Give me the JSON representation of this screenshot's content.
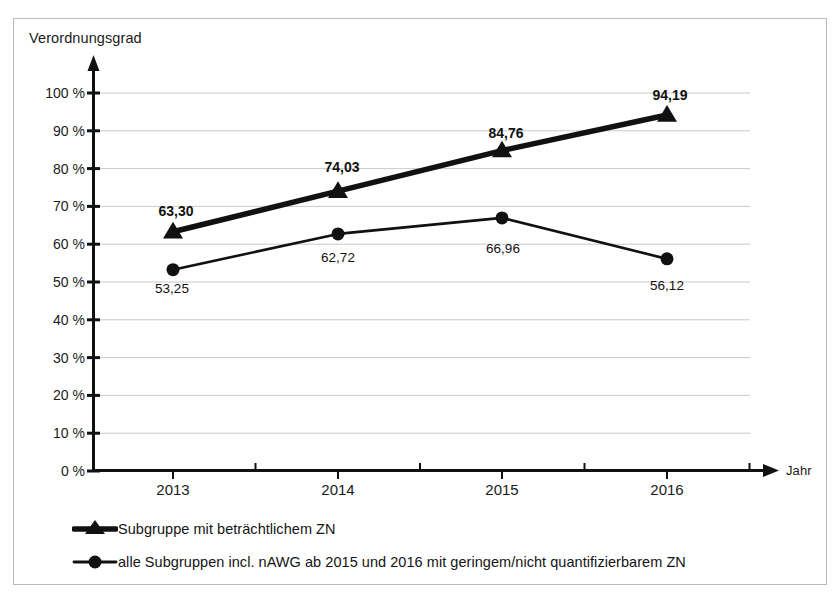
{
  "figure": {
    "background_color": "#ffffff",
    "frame_color": "#b9b9b9",
    "series_color": "#111111",
    "gridline_color": "#c9c9c9",
    "axis_color": "#111111"
  },
  "chart_data": {
    "type": "line",
    "title": "",
    "subtitle": "",
    "xlabel": "Jahr",
    "ylabel": "Verordnungsgrad",
    "categories": [
      "2013",
      "2014",
      "2015",
      "2016"
    ],
    "x": [
      2013,
      2014,
      2015,
      2016
    ],
    "ylim": [
      0,
      100
    ],
    "yticks": [
      0,
      10,
      20,
      30,
      40,
      50,
      60,
      70,
      80,
      90,
      100
    ],
    "ytick_labels": [
      "0 %",
      "10 %",
      "20 %",
      "30 %",
      "40 %",
      "50 %",
      "60 %",
      "70 %",
      "80 %",
      "90 %",
      "100 %"
    ],
    "grid": true,
    "grid_axis": "y",
    "legend_position": "below-plot-left",
    "series": [
      {
        "name": "Subgruppe mit beträchtlichem ZN",
        "marker": "triangle",
        "line_width": "thick",
        "values": [
          63.3,
          74.03,
          84.76,
          94.19
        ],
        "labels": [
          "63,30",
          "74,03",
          "84,76",
          "94,19"
        ],
        "label_bold": true
      },
      {
        "name": "alle Subgruppen incl. nAWG ab 2015 und 2016 mit geringem/nicht quantifizierbarem ZN",
        "marker": "circle",
        "line_width": "thin",
        "values": [
          53.25,
          62.72,
          66.96,
          56.12
        ],
        "labels": [
          "53,25",
          "62,72",
          "66,96",
          "56,12"
        ],
        "label_bold": false
      }
    ]
  },
  "legend": {
    "items": [
      {
        "label": "Subgruppe mit beträchtlichem ZN",
        "marker_icon": "triangle-marker-icon"
      },
      {
        "label": "alle Subgruppen incl. nAWG ab 2015 und 2016 mit geringem/nicht quantifizierbarem ZN",
        "marker_icon": "circle-marker-icon"
      }
    ]
  },
  "point_labels": {
    "s1": [
      {
        "text": "63,30",
        "x": 176,
        "y": 211
      },
      {
        "text": "74,03",
        "x": 342,
        "y": 167
      },
      {
        "text": "84,76",
        "x": 506,
        "y": 133
      },
      {
        "text": "94,19",
        "x": 670,
        "y": 95
      }
    ],
    "s2": [
      {
        "text": "53,25",
        "x": 172,
        "y": 288
      },
      {
        "text": "62,72",
        "x": 338,
        "y": 257
      },
      {
        "text": "66,96",
        "x": 503,
        "y": 248
      },
      {
        "text": "56,12",
        "x": 667,
        "y": 285
      }
    ]
  },
  "x_tick_positions": [
    173,
    338,
    502,
    667
  ]
}
